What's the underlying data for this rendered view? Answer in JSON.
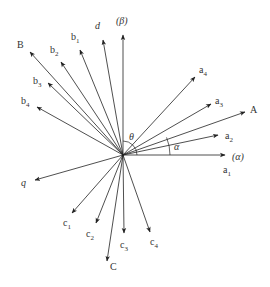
{
  "diagram": {
    "type": "phasor-vector-diagram",
    "origin": [
      123,
      155
    ],
    "line_color": "#222222",
    "text_color": "#333333",
    "vectors": [
      {
        "id": "beta",
        "tip": [
          123,
          35
        ],
        "label": "(β)",
        "sub": "",
        "italic": true,
        "label_pos": [
          116,
          24
        ]
      },
      {
        "id": "d",
        "tip": [
          103,
          40
        ],
        "label": "d",
        "sub": "",
        "italic": true,
        "label_pos": [
          95,
          29
        ]
      },
      {
        "id": "b1",
        "tip": [
          80,
          50
        ],
        "label": "b",
        "sub": "1",
        "italic": false,
        "label_pos": [
          71,
          40
        ]
      },
      {
        "id": "b2",
        "tip": [
          61,
          62
        ],
        "label": "b",
        "sub": "2",
        "italic": false,
        "label_pos": [
          50,
          53
        ]
      },
      {
        "id": "B",
        "tip": [
          30,
          52
        ],
        "label": "B",
        "sub": "",
        "italic": false,
        "label_pos": [
          17,
          48
        ]
      },
      {
        "id": "b3",
        "tip": [
          48,
          83
        ],
        "label": "b",
        "sub": "3",
        "italic": false,
        "label_pos": [
          33,
          84
        ]
      },
      {
        "id": "b4",
        "tip": [
          37,
          107
        ],
        "label": "b",
        "sub": "4",
        "italic": false,
        "label_pos": [
          21,
          104
        ]
      },
      {
        "id": "q",
        "tip": [
          35,
          180
        ],
        "label": "q",
        "sub": "",
        "italic": true,
        "label_pos": [
          21,
          186
        ]
      },
      {
        "id": "c1",
        "tip": [
          72,
          213
        ],
        "label": "c",
        "sub": "1",
        "italic": false,
        "label_pos": [
          63,
          226
        ]
      },
      {
        "id": "c2",
        "tip": [
          96,
          223
        ],
        "label": "c",
        "sub": "2",
        "italic": false,
        "label_pos": [
          86,
          237
        ]
      },
      {
        "id": "C",
        "tip": [
          107,
          261
        ],
        "label": "C",
        "sub": "",
        "italic": false,
        "label_pos": [
          110,
          270
        ]
      },
      {
        "id": "c3",
        "tip": [
          124,
          233
        ],
        "label": "c",
        "sub": "3",
        "italic": false,
        "label_pos": [
          120,
          248
        ]
      },
      {
        "id": "c4",
        "tip": [
          150,
          232
        ],
        "label": "c",
        "sub": "4",
        "italic": false,
        "label_pos": [
          150,
          245
        ]
      },
      {
        "id": "alpha",
        "tip": [
          225,
          155
        ],
        "label": "(α)",
        "sub": "",
        "italic": true,
        "label_pos": [
          232,
          160
        ]
      },
      {
        "id": "a2",
        "tip": [
          218,
          135
        ],
        "label": "a",
        "sub": "2",
        "italic": false,
        "label_pos": [
          225,
          139
        ]
      },
      {
        "id": "A",
        "tip": [
          245,
          112
        ],
        "label": "A",
        "sub": "",
        "italic": false,
        "label_pos": [
          250,
          113
        ]
      },
      {
        "id": "a3",
        "tip": [
          211,
          104
        ],
        "label": "a",
        "sub": "3",
        "italic": false,
        "label_pos": [
          215,
          104
        ]
      },
      {
        "id": "a4",
        "tip": [
          195,
          77
        ],
        "label": "a",
        "sub": "4",
        "italic": false,
        "label_pos": [
          199,
          73
        ]
      }
    ],
    "extra_labels": [
      {
        "id": "a1",
        "label": "a",
        "sub": "1",
        "italic": false,
        "pos": [
          223,
          173
        ]
      }
    ],
    "angles": [
      {
        "id": "theta",
        "label": "θ",
        "radius": 14,
        "from_deg": 0,
        "to_deg": 90,
        "label_pos": [
          129,
          140
        ]
      },
      {
        "id": "alpha",
        "label": "α",
        "radius": 47,
        "from_deg": 0,
        "to_deg": 22,
        "label_pos": [
          174,
          150
        ]
      }
    ]
  }
}
